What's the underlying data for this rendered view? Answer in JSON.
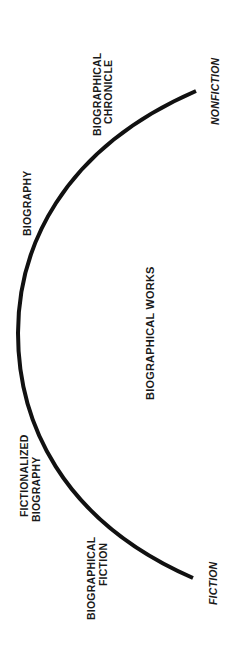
{
  "diagram": {
    "title": "BIOGRAPHICAL WORKS",
    "orientation": "rotated -90deg",
    "arc": {
      "stroke_color": "#111111",
      "stroke_width": 4
    },
    "endpoints": {
      "nonfiction": "NONFICTION",
      "fiction": "FICTION"
    },
    "categories": [
      {
        "id": "biographical-chronicle",
        "line1": "BIOGRAPHICAL",
        "line2": "CHRONICLE"
      },
      {
        "id": "biography",
        "line1": "BIOGRAPHY",
        "line2": ""
      },
      {
        "id": "fictionalized-biography",
        "line1": "FICTIONALIZED",
        "line2": "BIOGRAPHY"
      },
      {
        "id": "biographical-fiction",
        "line1": "BIOGRAPHICAL",
        "line2": "FICTION"
      }
    ],
    "text_color": "#1a1a1a",
    "background": "#ffffff"
  }
}
